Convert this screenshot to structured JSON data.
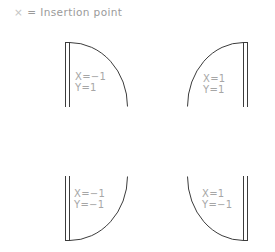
{
  "legend": {
    "symbol": "×",
    "text": "= Insertion point"
  },
  "colors": {
    "line": "#3c3c3c",
    "label": "#a6a6a6",
    "legend": "#9a9a9a"
  },
  "doors": [
    {
      "id": "top-left",
      "x_label": "X=−1",
      "y_label": "Y=1"
    },
    {
      "id": "top-right",
      "x_label": "X=1",
      "y_label": "Y=1"
    },
    {
      "id": "bottom-left",
      "x_label": "X=−1",
      "y_label": "Y=−1"
    },
    {
      "id": "bottom-right",
      "x_label": "X=1",
      "y_label": "Y=−1"
    }
  ]
}
